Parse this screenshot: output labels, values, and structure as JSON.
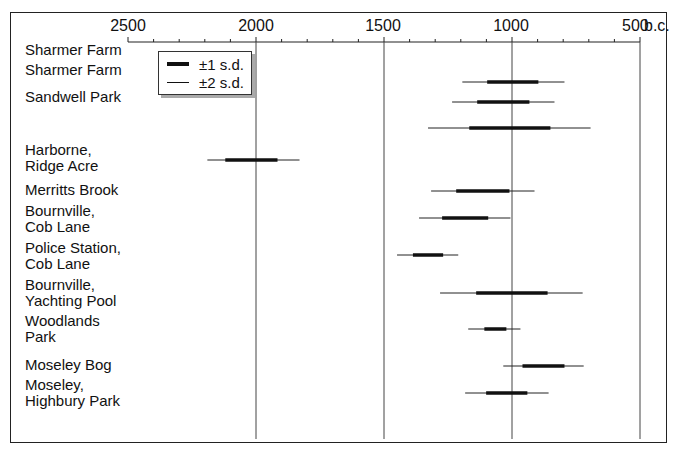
{
  "chart_data": {
    "type": "interval",
    "title": "",
    "xlabel": "b.c.",
    "xlim": [
      2500,
      500
    ],
    "x_axis": {
      "ticks": [
        2500,
        2000,
        1500,
        1000,
        500
      ],
      "tick_labels": [
        "2500",
        "2000",
        "1500",
        "1000",
        "500"
      ],
      "unit_label": "b.c.",
      "minor_tick_step": 100,
      "reversed": true
    },
    "gridlines_at": [
      2000,
      1500,
      1000,
      500
    ],
    "legend": [
      {
        "label": "±1 s.d.",
        "style": "thick"
      },
      {
        "label": "±2 s.d.",
        "style": "thin"
      }
    ],
    "series": [
      {
        "site": "Sharmer Farm",
        "label_lines": [
          "Sharmer Farm"
        ],
        "sd1": [
          1097,
          897
        ],
        "sd2": [
          1194,
          795
        ]
      },
      {
        "site": "Sharmer Farm",
        "label_lines": [
          "Sharmer Farm"
        ],
        "sd1": [
          1136,
          932
        ],
        "sd2": [
          1234,
          834
        ]
      },
      {
        "site": "Sandwell Park",
        "label_lines": [
          "Sandwell Park"
        ],
        "sd1": [
          1167,
          850
        ],
        "sd2": [
          1328,
          693
        ]
      },
      {
        "site": "Harborne, Ridge Acre",
        "label_lines": [
          "Harborne,",
          "Ridge Acre"
        ],
        "sd1": [
          2120,
          1916
        ],
        "sd2": [
          2190,
          1830
        ]
      },
      {
        "site": "Merritts Brook",
        "label_lines": [
          "Merritts Brook"
        ],
        "sd1": [
          1218,
          1010
        ],
        "sd2": [
          1316,
          912
        ]
      },
      {
        "site": "Bournville, Cob Lane",
        "label_lines": [
          "Bournville,",
          "Cob Lane"
        ],
        "sd1": [
          1273,
          1093
        ],
        "sd2": [
          1363,
          1006
        ]
      },
      {
        "site": "Police Station, Cob Lane",
        "label_lines": [
          "Police Station,",
          "Cob Lane"
        ],
        "sd1": [
          1387,
          1269
        ],
        "sd2": [
          1449,
          1210
        ]
      },
      {
        "site": "Bournville, Yachting Pool",
        "label_lines": [
          "Bournville,",
          "Yachting Pool"
        ],
        "sd1": [
          1140,
          861
        ],
        "sd2": [
          1281,
          724
        ]
      },
      {
        "site": "Woodlands Park",
        "label_lines": [
          "Woodlands",
          "Park"
        ],
        "sd1": [
          1108,
          1022
        ],
        "sd2": [
          1171,
          967
        ]
      },
      {
        "site": "Moseley Bog",
        "label_lines": [
          "Moseley Bog"
        ],
        "sd1": [
          959,
          795
        ],
        "sd2": [
          1034,
          720
        ]
      },
      {
        "site": "Moseley, Highbury Park",
        "label_lines": [
          "Moseley,",
          "Highbury Park"
        ],
        "sd1": [
          1101,
          940
        ],
        "sd2": [
          1183,
          857
        ]
      }
    ],
    "row_y_px": [
      82,
      102,
      128,
      160,
      191,
      218,
      255,
      293,
      329,
      366,
      393
    ],
    "label_y_px": [
      42,
      62,
      89,
      109,
      180,
      202,
      240,
      279,
      316,
      357,
      377
    ],
    "grid": true,
    "legend_position": "top-left (inside plot)"
  },
  "axis": {
    "tick_labels": [
      "2500",
      "2000",
      "1500",
      "1000",
      "500"
    ],
    "unit": "b.c."
  },
  "legend": {
    "sd1_label": "±1 s.d.",
    "sd2_label": "±2 s.d."
  },
  "labels": [
    "Sharmer Farm",
    "Sharmer Farm",
    "Sandwell Park",
    "Harborne,\nRidge Acre",
    "Merritts Brook",
    "Bournville,\nCob Lane",
    "Police Station,\nCob Lane",
    "Bournville,\nYachting Pool",
    "Woodlands\nPark",
    "Moseley Bog",
    "Moseley,\nHighbury Park"
  ]
}
